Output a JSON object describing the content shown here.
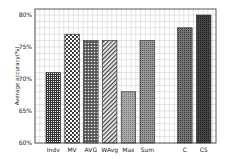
{
  "chart_data": {
    "type": "bar",
    "title": "",
    "xlabel": "",
    "ylabel": "Average accuracy(%)",
    "ylim": [
      60,
      80
    ],
    "yticks": [
      "60%",
      "65%",
      "70%",
      "75%",
      "80%"
    ],
    "grid": true,
    "legend": null,
    "categories": [
      "Indv",
      "MV",
      "AVG",
      "WAvg",
      "Max",
      "Sum",
      "C",
      "CS"
    ],
    "values": [
      71,
      77,
      76,
      76,
      68,
      76,
      78,
      80
    ],
    "patterns": [
      "dense-grid",
      "large-dots",
      "dots-dark",
      "diagonal-hatch",
      "fine-dots-light",
      "fine-dots",
      "fine-dots-dark",
      "dense-dark"
    ],
    "gap_after_index": 5
  },
  "colors": {
    "frame": "#333333",
    "grid": "#c8c8c8",
    "bar_outline": "#222222"
  }
}
